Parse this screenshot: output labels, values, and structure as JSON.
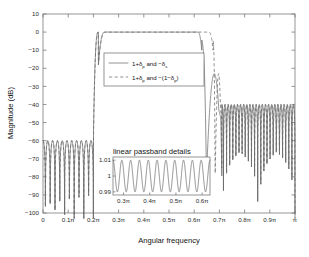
{
  "chart_data": {
    "type": "line",
    "title": "",
    "xlabel": "Angular frequency",
    "ylabel": "Magnitude (dB)",
    "xlim": [
      0,
      1
    ],
    "ylim": [
      -100,
      10
    ],
    "xticks": [
      0,
      0.1,
      0.2,
      0.3,
      0.4,
      0.5,
      0.6,
      0.7,
      0.8,
      0.9,
      1
    ],
    "xticklabels": [
      "0",
      "0.1π",
      "0.2π",
      "0.3π",
      "0.4π",
      "0.5π",
      "0.6π",
      "0.7π",
      "0.8π",
      "0.9π",
      "π"
    ],
    "yticks": [
      10,
      0,
      -10,
      -20,
      -30,
      -40,
      -50,
      -60,
      -70,
      -80,
      -90,
      -100
    ],
    "yticklabels": [
      "10",
      "0",
      "−10",
      "−20",
      "−30",
      "−40",
      "−50",
      "−60",
      "−70",
      "−80",
      "−90",
      "−100"
    ],
    "grid": false,
    "legend_position": "upper center",
    "series": [
      {
        "name": "1+δ_p and −δ_s",
        "style": "solid",
        "color": "#6b6b6b",
        "passband_start": 0.22,
        "passband_end": 0.63,
        "passband_level_db": 0,
        "lower_stopband_peak_db": -60,
        "upper_stopband_peak_db": -40,
        "lower_stopband_end": 0.2,
        "upper_stopband_start": 0.71
      },
      {
        "name": "1+δ_p and −(1−δ_p)",
        "style": "dashed",
        "color": "#6b6b6b",
        "passband_start": 0.22,
        "passband_end": 0.675,
        "passband_level_db": 0,
        "lower_stopband_peak_db": -60,
        "upper_stopband_peak_db": -40,
        "lower_stopband_end": 0.2,
        "upper_stopband_start": 0.71
      }
    ],
    "inset": {
      "title": "linear passband details",
      "type": "line",
      "xlim": [
        0.26,
        0.63
      ],
      "ylim": [
        0.988,
        1.012
      ],
      "xticks": [
        0.3,
        0.4,
        0.5,
        0.6
      ],
      "xticklabels": [
        "0.3π",
        "0.4π",
        "0.5π",
        "0.6π"
      ],
      "yticks": [
        1.01,
        1,
        0.99
      ],
      "yticklabels": [
        "1.01",
        "1",
        "0.99"
      ],
      "ripple_cycles": 11,
      "ripple_amplitude": 0.01,
      "ripple_center": 1.0
    }
  },
  "legend": {
    "entries": [
      {
        "prefix": "1+δ",
        "sub1": "p",
        "middle": " and −δ",
        "sub2": "s",
        "suffix": "",
        "style": "solid"
      },
      {
        "prefix": "1+δ",
        "sub1": "p",
        "middle": " and −(1−δ",
        "sub2": "p",
        "suffix": ")",
        "style": "dashed"
      }
    ]
  }
}
